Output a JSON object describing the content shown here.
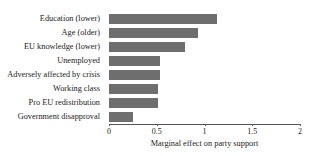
{
  "chart_data": {
    "type": "bar",
    "orientation": "horizontal",
    "title": "",
    "xlabel": "Marginal effect on party support",
    "ylabel": "",
    "categories": [
      "Education (lower)",
      "Age (older)",
      "EU knowledge (lower)",
      "Unemployed",
      "Adversely affected by crisis",
      "Working class",
      "Pro EU redistribution",
      "Government disapproval"
    ],
    "values": [
      1.13,
      0.93,
      0.8,
      0.53,
      0.53,
      0.51,
      0.51,
      0.25
    ],
    "xlim": [
      0,
      2
    ],
    "xticks": [
      0,
      0.5,
      1,
      1.5,
      2
    ],
    "xtick_labels": [
      "0",
      "0.5",
      "1",
      "1.5",
      "2"
    ],
    "grid": false,
    "legend": false,
    "bar_color": "#6e6e6e",
    "axis_color": "#55555a",
    "background_color": "#ffffff",
    "text_color": "#1a1a1a"
  }
}
